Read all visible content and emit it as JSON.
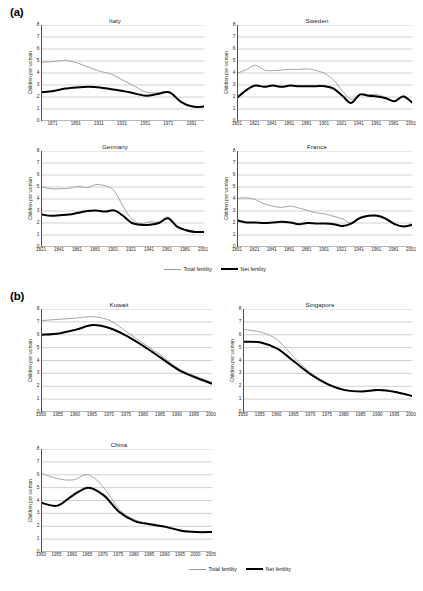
{
  "panels": {
    "a_label": "(a)",
    "b_label": "(b)"
  },
  "legend": {
    "total_label": "Total fertility",
    "net_label": "Net fertility",
    "total_color": "#9a9a9a",
    "net_color": "#000000"
  },
  "axis": {
    "ylabel": "Children per woman",
    "yticks": [
      "0",
      "1",
      "2",
      "3",
      "4",
      "5",
      "6",
      "7",
      "8"
    ]
  },
  "chart_data": [
    {
      "id": "italy",
      "type": "line",
      "title": "Italy",
      "panel": "a",
      "xlabel": "",
      "ylabel": "Children per woman",
      "ylim": [
        0,
        8
      ],
      "xlim": [
        1861,
        2001
      ],
      "grid": true,
      "legend_position": "below-group",
      "ticklabels": [
        "1871",
        "1891",
        "1911",
        "1931",
        "1951",
        "1971",
        "1991"
      ],
      "tickvalues": [
        1871,
        1891,
        1911,
        1931,
        1951,
        1971,
        1991
      ],
      "x": [
        1861,
        1871,
        1881,
        1891,
        1901,
        1911,
        1921,
        1931,
        1941,
        1951,
        1961,
        1971,
        1981,
        1991,
        2001
      ],
      "series": [
        {
          "name": "Total fertility",
          "color": "#9a9a9a",
          "values": [
            4.9,
            4.95,
            5.05,
            4.85,
            4.5,
            4.15,
            3.9,
            3.4,
            2.9,
            2.4,
            2.35,
            2.4,
            1.6,
            1.25,
            1.2
          ]
        },
        {
          "name": "Net fertility",
          "color": "#000000",
          "values": [
            2.4,
            2.5,
            2.7,
            2.8,
            2.85,
            2.8,
            2.65,
            2.5,
            2.3,
            2.1,
            2.25,
            2.4,
            1.6,
            1.2,
            1.2
          ]
        }
      ]
    },
    {
      "id": "sweden",
      "type": "line",
      "title": "Sweden",
      "panel": "a",
      "xlabel": "",
      "ylabel": "Children per woman",
      "ylim": [
        0,
        8
      ],
      "xlim": [
        1801,
        2001
      ],
      "grid": true,
      "ticklabels": [
        "1801",
        "1821",
        "1841",
        "1861",
        "1881",
        "1901",
        "1921",
        "1941",
        "1961",
        "1981",
        "2001"
      ],
      "tickvalues": [
        1801,
        1821,
        1841,
        1861,
        1881,
        1901,
        1921,
        1941,
        1961,
        1981,
        2001
      ],
      "x": [
        1801,
        1811,
        1821,
        1831,
        1841,
        1851,
        1861,
        1871,
        1881,
        1891,
        1901,
        1911,
        1921,
        1931,
        1941,
        1951,
        1961,
        1971,
        1981,
        1991,
        2001
      ],
      "series": [
        {
          "name": "Total fertility",
          "color": "#9a9a9a",
          "values": [
            4.0,
            4.3,
            4.65,
            4.25,
            4.2,
            4.25,
            4.3,
            4.3,
            4.35,
            4.2,
            3.95,
            3.4,
            2.5,
            1.8,
            2.2,
            2.2,
            2.2,
            1.95,
            1.65,
            2.1,
            1.55
          ]
        },
        {
          "name": "Net fertility",
          "color": "#000000",
          "values": [
            2.0,
            2.6,
            2.95,
            2.85,
            2.95,
            2.85,
            2.95,
            2.9,
            2.9,
            2.9,
            2.9,
            2.7,
            2.1,
            1.5,
            2.2,
            2.1,
            2.05,
            1.9,
            1.65,
            2.05,
            1.55
          ]
        }
      ]
    },
    {
      "id": "germany",
      "type": "line",
      "title": "Germany",
      "panel": "a",
      "xlabel": "",
      "ylabel": "Children per woman",
      "ylim": [
        0,
        8
      ],
      "xlim": [
        1821,
        2001
      ],
      "grid": true,
      "ticklabels": [
        "1821",
        "1841",
        "1861",
        "1881",
        "1901",
        "1921",
        "1941",
        "1961",
        "1981",
        "2001"
      ],
      "tickvalues": [
        1821,
        1841,
        1861,
        1881,
        1901,
        1921,
        1941,
        1961,
        1981,
        2001
      ],
      "x": [
        1821,
        1831,
        1841,
        1851,
        1861,
        1871,
        1881,
        1891,
        1901,
        1911,
        1921,
        1931,
        1941,
        1951,
        1961,
        1971,
        1981,
        1991,
        2001
      ],
      "series": [
        {
          "name": "Total fertility",
          "color": "#9a9a9a",
          "values": [
            5.0,
            4.85,
            4.85,
            4.9,
            5.05,
            4.95,
            5.2,
            5.1,
            4.7,
            3.4,
            2.3,
            1.95,
            2.1,
            2.1,
            2.5,
            1.75,
            1.45,
            1.3,
            1.25
          ]
        },
        {
          "name": "Net fertility",
          "color": "#000000",
          "values": [
            2.7,
            2.6,
            2.65,
            2.7,
            2.85,
            3.0,
            3.05,
            2.95,
            3.05,
            2.6,
            2.0,
            1.85,
            1.85,
            2.0,
            2.4,
            1.7,
            1.4,
            1.25,
            1.25
          ]
        }
      ]
    },
    {
      "id": "france",
      "type": "line",
      "title": "France",
      "panel": "a",
      "xlabel": "",
      "ylabel": "Children per woman",
      "ylim": [
        0,
        8
      ],
      "xlim": [
        1801,
        2001
      ],
      "grid": true,
      "ticklabels": [
        "1801",
        "1821",
        "1841",
        "1861",
        "1881",
        "1901",
        "1921",
        "1941",
        "1961",
        "1981",
        "2001"
      ],
      "tickvalues": [
        1801,
        1821,
        1841,
        1861,
        1881,
        1901,
        1921,
        1941,
        1961,
        1981,
        2001
      ],
      "x": [
        1801,
        1811,
        1821,
        1831,
        1841,
        1851,
        1861,
        1871,
        1881,
        1891,
        1901,
        1911,
        1921,
        1931,
        1941,
        1951,
        1961,
        1971,
        1981,
        1991,
        2001
      ],
      "series": [
        {
          "name": "Total fertility",
          "color": "#9a9a9a",
          "values": [
            4.05,
            4.1,
            3.95,
            3.6,
            3.4,
            3.3,
            3.4,
            3.25,
            3.05,
            2.85,
            2.75,
            2.55,
            2.35,
            2.0,
            2.5,
            2.6,
            2.65,
            2.4,
            1.95,
            1.75,
            1.85
          ]
        },
        {
          "name": "Net fertility",
          "color": "#000000",
          "values": [
            2.2,
            2.05,
            2.05,
            2.0,
            2.05,
            2.1,
            2.05,
            1.9,
            2.0,
            1.95,
            1.95,
            1.9,
            1.75,
            1.95,
            2.4,
            2.6,
            2.6,
            2.35,
            1.9,
            1.7,
            1.85
          ]
        }
      ]
    },
    {
      "id": "kuwait",
      "type": "line",
      "title": "Kuwait",
      "panel": "b",
      "xlabel": "",
      "ylabel": "Children per woman",
      "ylim": [
        0,
        8
      ],
      "xlim": [
        1950,
        2000
      ],
      "grid": true,
      "ticklabels": [
        "1950",
        "1955",
        "1960",
        "1965",
        "1970",
        "1975",
        "1980",
        "1985",
        "1990",
        "1995",
        "2000"
      ],
      "tickvalues": [
        1950,
        1955,
        1960,
        1965,
        1970,
        1975,
        1980,
        1985,
        1990,
        1995,
        2000
      ],
      "x": [
        1950,
        1955,
        1960,
        1965,
        1970,
        1975,
        1980,
        1985,
        1990,
        1995,
        2000
      ],
      "series": [
        {
          "name": "Total fertility",
          "color": "#9a9a9a",
          "values": [
            7.1,
            7.2,
            7.3,
            7.4,
            7.1,
            6.2,
            5.3,
            4.4,
            3.4,
            2.8,
            2.3
          ]
        },
        {
          "name": "Net fertility",
          "color": "#000000",
          "values": [
            6.0,
            6.1,
            6.4,
            6.75,
            6.5,
            5.9,
            5.1,
            4.2,
            3.3,
            2.7,
            2.2
          ]
        }
      ]
    },
    {
      "id": "singapore",
      "type": "line",
      "title": "Singapore",
      "panel": "b",
      "xlabel": "",
      "ylabel": "Children per woman",
      "ylim": [
        0,
        8
      ],
      "xlim": [
        1950,
        2000
      ],
      "grid": true,
      "ticklabels": [
        "1950",
        "1955",
        "1960",
        "1965",
        "1970",
        "1975",
        "1980",
        "1985",
        "1990",
        "1995",
        "2000"
      ],
      "tickvalues": [
        1950,
        1955,
        1960,
        1965,
        1970,
        1975,
        1980,
        1985,
        1990,
        1995,
        2000
      ],
      "x": [
        1950,
        1955,
        1960,
        1965,
        1970,
        1975,
        1980,
        1985,
        1990,
        1995,
        2000
      ],
      "series": [
        {
          "name": "Total fertility",
          "color": "#9a9a9a",
          "values": [
            6.4,
            6.2,
            5.6,
            4.2,
            3.0,
            2.2,
            1.75,
            1.6,
            1.75,
            1.6,
            1.25
          ]
        },
        {
          "name": "Net fertility",
          "color": "#000000",
          "values": [
            5.45,
            5.4,
            4.9,
            3.9,
            2.9,
            2.15,
            1.7,
            1.6,
            1.7,
            1.55,
            1.25
          ]
        }
      ]
    },
    {
      "id": "china",
      "type": "line",
      "title": "China",
      "panel": "b",
      "xlabel": "",
      "ylabel": "Children per woman",
      "ylim": [
        0,
        8
      ],
      "xlim": [
        1950,
        2005
      ],
      "grid": true,
      "ticklabels": [
        "1950",
        "1955",
        "1960",
        "1965",
        "1970",
        "1975",
        "1980",
        "1985",
        "1990",
        "1995",
        "2000",
        "2005"
      ],
      "tickvalues": [
        1950,
        1955,
        1960,
        1965,
        1970,
        1975,
        1980,
        1985,
        1990,
        1995,
        2000,
        2005
      ],
      "x": [
        1950,
        1955,
        1960,
        1965,
        1970,
        1975,
        1980,
        1985,
        1990,
        1995,
        2000,
        2005
      ],
      "series": [
        {
          "name": "Total fertility",
          "color": "#9a9a9a",
          "values": [
            6.1,
            5.7,
            5.6,
            6.0,
            5.0,
            3.3,
            2.5,
            2.2,
            2.0,
            1.7,
            1.55,
            1.55
          ]
        },
        {
          "name": "Net fertility",
          "color": "#000000",
          "values": [
            3.8,
            3.6,
            4.4,
            5.0,
            4.4,
            3.1,
            2.4,
            2.15,
            1.95,
            1.65,
            1.55,
            1.55
          ]
        }
      ]
    }
  ]
}
